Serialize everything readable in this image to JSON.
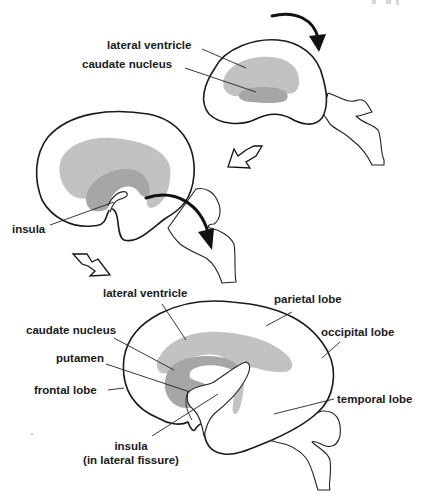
{
  "figure": {
    "type": "anatomical-diagram",
    "colors": {
      "outline": "#1a1a1a",
      "lateral_ventricle": "#c2c2c2",
      "caudate_nucleus": "#a6a6a6",
      "background": "#ffffff"
    }
  },
  "stage1": {
    "labels": {
      "lateral_ventricle": "lateral ventricle",
      "caudate_nucleus": "caudate nucleus"
    },
    "rotation_arrow": "curved-arrow-clockwise"
  },
  "stage2": {
    "labels": {
      "insula": "insula"
    },
    "rotation_arrow": "curved-arrow-downward"
  },
  "transitions": [
    {
      "icon": "hollow-arrow-down-left",
      "between": "stage1-stage2"
    },
    {
      "icon": "hollow-arrow-down-right",
      "between": "stage2-stage3"
    }
  ],
  "stage3": {
    "labels": {
      "lateral_ventricle": "lateral ventricle",
      "parietal_lobe": "parietal lobe",
      "caudate_nucleus": "caudate nucleus",
      "occipital_lobe": "occipital lobe",
      "putamen": "putamen",
      "frontal_lobe": "frontal lobe",
      "temporal_lobe": "temporal lobe",
      "insula_line1": "insula",
      "insula_line2": "(in lateral fissure)"
    }
  }
}
